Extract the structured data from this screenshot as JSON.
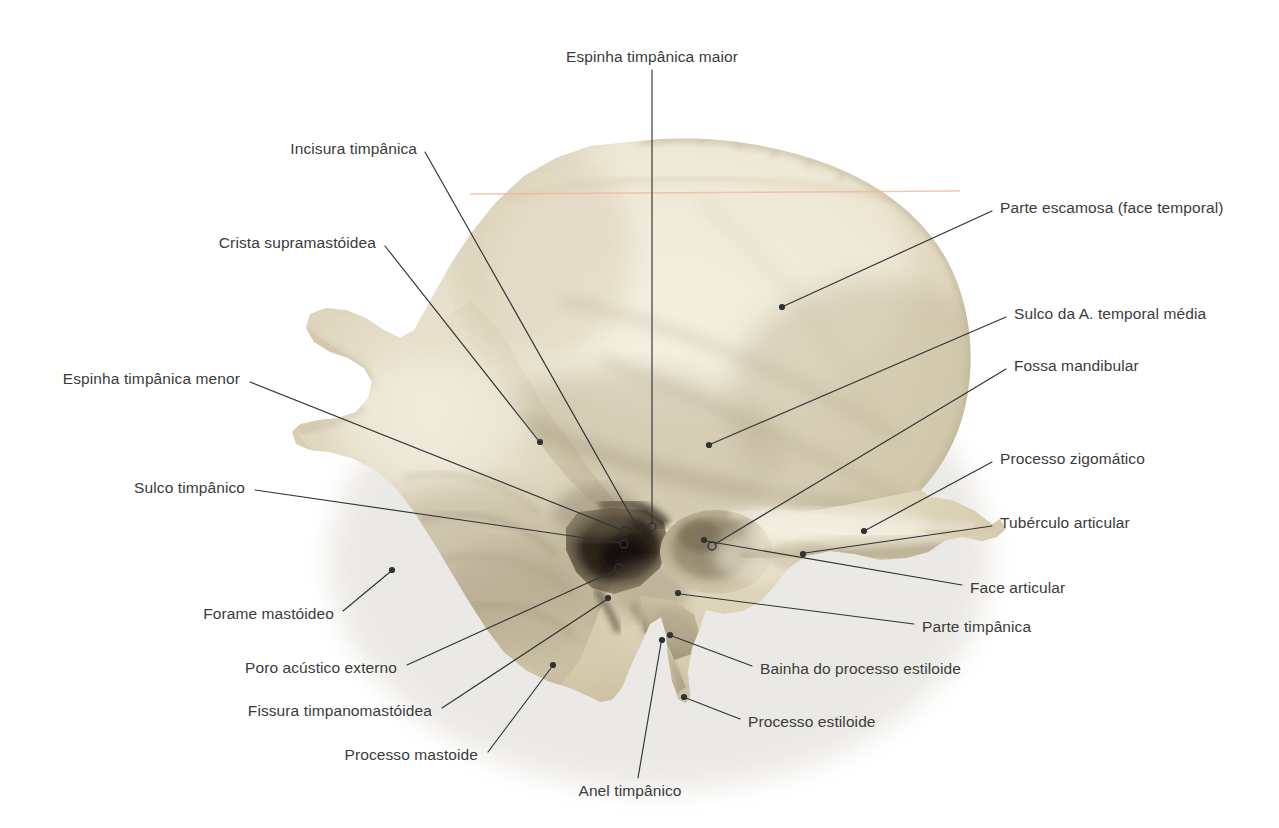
{
  "figure": {
    "background_color": "#ffffff",
    "text_color": "#3b3b3b",
    "leader_color": "#2f3336",
    "bone_light": "#efe9d6",
    "bone_mid": "#ddd3b9",
    "bone_shadow": "#a89a7d",
    "bone_dark": "#3a3026",
    "scanline_color": "#f2b49a"
  },
  "labels": [
    {
      "id": "espinha-timpanica-maior",
      "text": "Espinha timpânica maior",
      "align": "c",
      "text_x": 652,
      "text_y": 57,
      "path": [
        [
          652,
          70
        ],
        [
          652,
          524
        ]
      ],
      "marker": "open",
      "marker_x": 652,
      "marker_y": 527
    },
    {
      "id": "incisura-timpanica",
      "text": "Incisura timpânica",
      "align": "l",
      "text_x": 417,
      "text_y": 149,
      "path": [
        [
          425,
          152
        ],
        [
          636,
          525
        ]
      ],
      "marker": "open",
      "marker_x": 638,
      "marker_y": 528
    },
    {
      "id": "crista-supramastoidea",
      "text": "Crista supramastóidea",
      "align": "l",
      "text_x": 376,
      "text_y": 243,
      "path": [
        [
          385,
          246
        ],
        [
          538,
          440
        ]
      ],
      "marker": "dot",
      "marker_x": 540,
      "marker_y": 442
    },
    {
      "id": "espinha-timpanica-menor",
      "text": "Espinha timpânica menor",
      "align": "l",
      "text_x": 240,
      "text_y": 379,
      "path": [
        [
          250,
          382
        ],
        [
          622,
          530
        ]
      ],
      "marker": "open",
      "marker_x": 625,
      "marker_y": 531
    },
    {
      "id": "sulco-timpanico",
      "text": "Sulco timpânico",
      "align": "l",
      "text_x": 245,
      "text_y": 488,
      "path": [
        [
          255,
          490
        ],
        [
          620,
          543
        ]
      ],
      "marker": "open",
      "marker_x": 624,
      "marker_y": 544
    },
    {
      "id": "forame-mastoideo",
      "text": "Forame mastóideo",
      "align": "l",
      "text_x": 334,
      "text_y": 614,
      "path": [
        [
          343,
          611
        ],
        [
          390,
          572
        ]
      ],
      "marker": "dot",
      "marker_x": 392,
      "marker_y": 570
    },
    {
      "id": "poro-acustico-externo",
      "text": "Poro acústico externo",
      "align": "l",
      "text_x": 397,
      "text_y": 668,
      "path": [
        [
          407,
          665
        ],
        [
          616,
          570
        ]
      ],
      "marker": "open",
      "marker_x": 619,
      "marker_y": 568
    },
    {
      "id": "fissura-timpanomastoidea",
      "text": "Fissura timpanomastóidea",
      "align": "l",
      "text_x": 432,
      "text_y": 711,
      "path": [
        [
          442,
          708
        ],
        [
          606,
          600
        ]
      ],
      "marker": "dot",
      "marker_x": 608,
      "marker_y": 598
    },
    {
      "id": "processo-mastoide",
      "text": "Processo mastoide",
      "align": "l",
      "text_x": 478,
      "text_y": 755,
      "path": [
        [
          488,
          752
        ],
        [
          551,
          668
        ]
      ],
      "marker": "dot",
      "marker_x": 553,
      "marker_y": 665
    },
    {
      "id": "anel-timpanico",
      "text": "Anel timpânico",
      "align": "c",
      "text_x": 630,
      "text_y": 791,
      "path": [
        [
          638,
          778
        ],
        [
          661,
          643
        ]
      ],
      "marker": "dot",
      "marker_x": 662,
      "marker_y": 640
    },
    {
      "id": "parte-escamosa-face-temporal",
      "text": "Parte escamosa (face temporal)",
      "align": "r",
      "text_x": 1000,
      "text_y": 208,
      "path": [
        [
          992,
          211
        ],
        [
          784,
          306
        ]
      ],
      "marker": "dot",
      "marker_x": 782,
      "marker_y": 307
    },
    {
      "id": "sulco-da-a-temporal-media",
      "text": "Sulco da A. temporal média",
      "align": "r",
      "text_x": 1014,
      "text_y": 314,
      "path": [
        [
          1006,
          317
        ],
        [
          711,
          444
        ]
      ],
      "marker": "dot",
      "marker_x": 709,
      "marker_y": 445
    },
    {
      "id": "fossa-mandibular",
      "text": "Fossa mandibular",
      "align": "r",
      "text_x": 1014,
      "text_y": 366,
      "path": [
        [
          1006,
          369
        ],
        [
          715,
          544
        ]
      ],
      "marker": "open",
      "marker_x": 712,
      "marker_y": 546
    },
    {
      "id": "processo-zigomatico",
      "text": "Processo zigomático",
      "align": "r",
      "text_x": 1000,
      "text_y": 459,
      "path": [
        [
          992,
          462
        ],
        [
          866,
          530
        ]
      ],
      "marker": "dot",
      "marker_x": 864,
      "marker_y": 531
    },
    {
      "id": "tuberculo-articular",
      "text": "Tubérculo articular",
      "align": "r",
      "text_x": 1000,
      "text_y": 523,
      "path": [
        [
          992,
          526
        ],
        [
          805,
          553
        ]
      ],
      "marker": "dot",
      "marker_x": 803,
      "marker_y": 554
    },
    {
      "id": "face-articular",
      "text": "Face articular",
      "align": "r",
      "text_x": 970,
      "text_y": 588,
      "path": [
        [
          962,
          585
        ],
        [
          706,
          541
        ]
      ],
      "marker": "dot",
      "marker_x": 704,
      "marker_y": 540
    },
    {
      "id": "parte-timpanica",
      "text": "Parte timpânica",
      "align": "r",
      "text_x": 922,
      "text_y": 627,
      "path": [
        [
          914,
          624
        ],
        [
          680,
          594
        ]
      ],
      "marker": "dot",
      "marker_x": 678,
      "marker_y": 593
    },
    {
      "id": "bainha-do-processo-estiloide",
      "text": "Bainha do processo estiloide",
      "align": "r",
      "text_x": 760,
      "text_y": 669,
      "path": [
        [
          752,
          666
        ],
        [
          672,
          636
        ]
      ],
      "marker": "dot",
      "marker_x": 670,
      "marker_y": 635
    },
    {
      "id": "processo-estiloide",
      "text": "Processo estiloide",
      "align": "r",
      "text_x": 748,
      "text_y": 722,
      "path": [
        [
          740,
          719
        ],
        [
          686,
          698
        ]
      ],
      "marker": "dot",
      "marker_x": 684,
      "marker_y": 697
    }
  ]
}
